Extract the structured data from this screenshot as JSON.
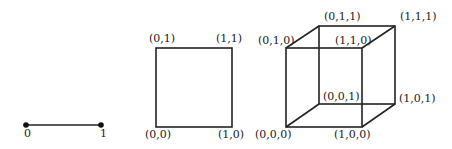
{
  "diagram": {
    "segment": {
      "vertices": [
        {
          "label": "0",
          "x": 26,
          "y": 125
        },
        {
          "label": "1",
          "x": 101,
          "y": 125
        }
      ]
    },
    "square": {
      "vertices": [
        {
          "label": "(0,0)",
          "x": 156,
          "y": 127
        },
        {
          "label": "(1,0)",
          "x": 232,
          "y": 127
        },
        {
          "label": "(0,1)",
          "x": 156,
          "y": 48
        },
        {
          "label": "(1,1)",
          "x": 232,
          "y": 48
        }
      ]
    },
    "cube": {
      "vertices": [
        {
          "label": "(0,0,0)",
          "x": 286,
          "y": 127
        },
        {
          "label": "(1,0,0)",
          "x": 362,
          "y": 127
        },
        {
          "label": "(0,1,0)",
          "x": 286,
          "y": 48
        },
        {
          "label": "(1,1,0)",
          "x": 362,
          "y": 48
        },
        {
          "label": "(0,0,1)",
          "x": 319,
          "y": 104
        },
        {
          "label": "(1,0,1)",
          "x": 395,
          "y": 104
        },
        {
          "label": "(0,1,1)",
          "x": 319,
          "y": 26
        },
        {
          "label": "(1,1,1)",
          "x": 395,
          "y": 26
        }
      ]
    }
  }
}
